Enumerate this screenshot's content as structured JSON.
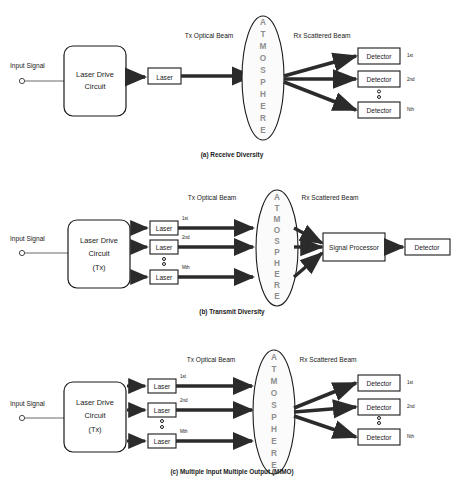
{
  "figure": {
    "type": "block-diagram"
  },
  "common": {
    "input_signal_label": "Input Signal",
    "tx_beam_label": "Tx Optical Beam",
    "rx_beam_label": "Rx Scattered Beam",
    "atmosphere_label": "ATMOSPHERE",
    "atmosphere_letters": [
      "A",
      "T",
      "M",
      "O",
      "S",
      "P",
      "H",
      "E",
      "R",
      "E"
    ],
    "laser_label": "Laser",
    "detector_label": "Detector",
    "signal_processor_label": "Signal Processor",
    "ldc_line1": "Laser Drive",
    "ldc_line2": "Circuit",
    "ldc_line3_tx": "(Tx)"
  },
  "panels": [
    {
      "id": "a",
      "caption": "(a) Receive Diversity",
      "drive_circuit": {
        "lines": [
          "Laser Drive",
          "Circuit"
        ]
      },
      "lasers": [
        {
          "label": "Laser",
          "index": ""
        }
      ],
      "detectors": [
        {
          "label": "Detector",
          "index": "1st"
        },
        {
          "label": "Detector",
          "index": "2nd"
        },
        {
          "label": "Detector",
          "index": "Nth"
        }
      ],
      "has_signal_processor": false,
      "ellipsis_between_detectors": true,
      "ellipsis_between_lasers": false
    },
    {
      "id": "b",
      "caption": "(b) Transmit Diversity",
      "drive_circuit": {
        "lines": [
          "Laser Drive",
          "Circuit",
          "(Tx)"
        ]
      },
      "lasers": [
        {
          "label": "Laser",
          "index": "1st"
        },
        {
          "label": "Laser",
          "index": "2nd"
        },
        {
          "label": "Laser",
          "index": "Mth"
        }
      ],
      "detectors": [
        {
          "label": "Detector",
          "index": ""
        }
      ],
      "signal_processor": "Signal Processor",
      "has_signal_processor": true,
      "ellipsis_between_detectors": false,
      "ellipsis_between_lasers": true
    },
    {
      "id": "c",
      "caption": "(c) Multiple Input Multiple Output (MIMO)",
      "drive_circuit": {
        "lines": [
          "Laser Drive",
          "Circuit",
          "(Tx)"
        ]
      },
      "lasers": [
        {
          "label": "Laser",
          "index": "1st"
        },
        {
          "label": "Laser",
          "index": "2nd"
        },
        {
          "label": "Laser",
          "index": "Mth"
        }
      ],
      "detectors": [
        {
          "label": "Detector",
          "index": "1st"
        },
        {
          "label": "Detector",
          "index": "2nd"
        },
        {
          "label": "Detector",
          "index": "Nth"
        }
      ],
      "has_signal_processor": false,
      "ellipsis_between_detectors": true,
      "ellipsis_between_lasers": true
    }
  ],
  "colors": {
    "stroke": "#1a1a1a",
    "beam": "#2b2b2b",
    "thin_wire": "#6a6a6a",
    "atmosphere_text": "#8e8e8e",
    "background": "#ffffff"
  }
}
